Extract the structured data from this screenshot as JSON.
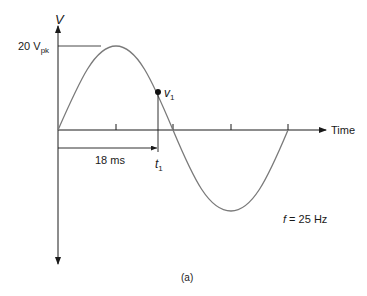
{
  "figure": {
    "caption": "(a)",
    "y_axis_label": "V",
    "x_axis_label": "Time",
    "peak_label_main": "20 V",
    "peak_label_sub": "pk",
    "point_label_main": "v",
    "point_label_sub": "1",
    "time_marker_main": "t",
    "time_marker_sub": "1",
    "interval_label": "18 ms",
    "frequency_label_var": "f",
    "frequency_label_rest": " = 25 Hz"
  },
  "waveform": {
    "type": "sine",
    "peak_voltage": 20,
    "peak_unit": "V",
    "frequency_hz": 25,
    "period_ms": 40,
    "cycles_shown": 1,
    "marked_time_ms": 18,
    "stroke_color": "#7a7a7a",
    "axis_color": "#1a1a1a"
  }
}
